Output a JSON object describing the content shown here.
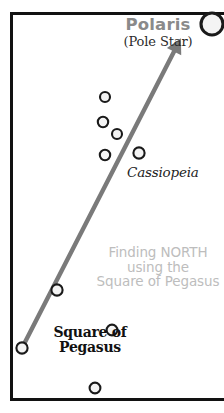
{
  "diagram": {
    "title": "Finding NORTH using the Square of Pegasus",
    "frame_color": "#121212",
    "background_color": "#ffffff"
  },
  "polaris": {
    "name": "Polaris",
    "subtitle": "(Pole Star)",
    "name_color": "#8a8a8a",
    "subtitle_color": "#2b2b2b",
    "star": {
      "x": 212,
      "y": 24,
      "r": 11
    }
  },
  "cassiopeia": {
    "label": "Cassiopeia",
    "label_color": "#1d1d1d",
    "stars": [
      {
        "x": 105,
        "y": 97,
        "r": 5.0
      },
      {
        "x": 103,
        "y": 122,
        "r": 5.2
      },
      {
        "x": 117,
        "y": 134,
        "r": 5.0
      },
      {
        "x": 105,
        "y": 155,
        "r": 5.2
      },
      {
        "x": 139,
        "y": 153,
        "r": 5.6
      }
    ]
  },
  "pegasus": {
    "label_line1": "Square of",
    "label_line2": "Pegasus",
    "label_color": "#111111",
    "stars": [
      {
        "x": 57,
        "y": 290,
        "r": 5.6
      },
      {
        "x": 22,
        "y": 348,
        "r": 5.6
      },
      {
        "x": 112,
        "y": 330,
        "r": 5.4
      },
      {
        "x": 95,
        "y": 388,
        "r": 5.4
      }
    ]
  },
  "caption": {
    "line1": "Finding NORTH",
    "line2": "using the",
    "line3": "Square of Pegasus",
    "color": "#bdbdbd"
  },
  "arrow": {
    "color": "#7a7a7a",
    "width": 4.4,
    "from": {
      "x": 22,
      "y": 348
    },
    "to": {
      "x": 180,
      "y": 40
    },
    "head_size": 13
  },
  "star_style": {
    "fill": "#f4f4f4",
    "stroke": "#1a1a1a",
    "stroke_width": 2.1
  }
}
